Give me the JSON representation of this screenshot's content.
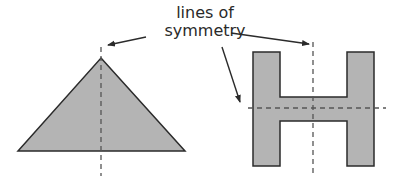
{
  "label": {
    "line1": "lines of",
    "line2": "symmetry"
  },
  "colors": {
    "shape_fill": "#b4b4b4",
    "shape_stroke": "#2b2b2b",
    "dash": "#555555",
    "arrow": "#2b2b2b",
    "text": "#2a2a2a"
  },
  "shapes": [
    {
      "name": "triangle",
      "lines_of_symmetry": 1
    },
    {
      "name": "letter-H",
      "lines_of_symmetry": 2
    }
  ]
}
